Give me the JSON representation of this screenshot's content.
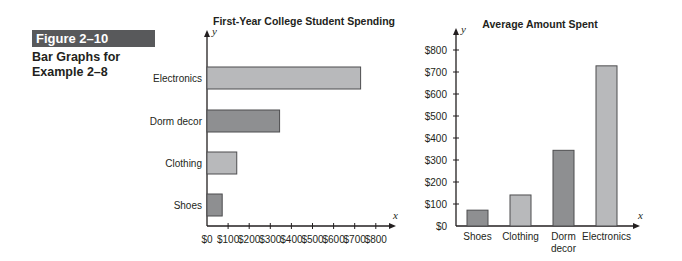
{
  "figure": {
    "label": "Figure 2–10",
    "caption_line1": "Bar Graphs for",
    "caption_line2": "Example 2–8"
  },
  "colors": {
    "badge_bg": "#58595b",
    "bar_light": "#b8b9bb",
    "bar_dark": "#8e8f91",
    "bar_stroke": "#4d4d4f",
    "axis": "#231f20"
  },
  "chart_data": [
    {
      "type": "bar",
      "orientation": "horizontal",
      "title": "First-Year College Student Spending",
      "xlabel": "x",
      "ylabel": "y",
      "categories": [
        "Electronics",
        "Dorm decor",
        "Clothing",
        "Shoes"
      ],
      "values": [
        728,
        344,
        141,
        72
      ],
      "xticks": [
        "$0",
        "$100",
        "$200",
        "$300",
        "$400",
        "$500",
        "$600",
        "$700",
        "$800"
      ],
      "xlim": [
        0,
        800
      ],
      "grid": false,
      "legend": null
    },
    {
      "type": "bar",
      "orientation": "vertical",
      "title": "Average Amount Spent",
      "xlabel": "x",
      "ylabel": "y",
      "categories": [
        "Shoes",
        "Clothing",
        "Dorm decor",
        "Electronics"
      ],
      "category_lines": [
        [
          "Shoes"
        ],
        [
          "Clothing"
        ],
        [
          "Dorm",
          "decor"
        ],
        [
          "Electronics"
        ]
      ],
      "values": [
        72,
        141,
        344,
        728
      ],
      "yticks": [
        "$0",
        "$100",
        "$200",
        "$300",
        "$400",
        "$500",
        "$600",
        "$700",
        "$800"
      ],
      "ylim": [
        0,
        800
      ],
      "grid": false,
      "legend": null
    }
  ]
}
